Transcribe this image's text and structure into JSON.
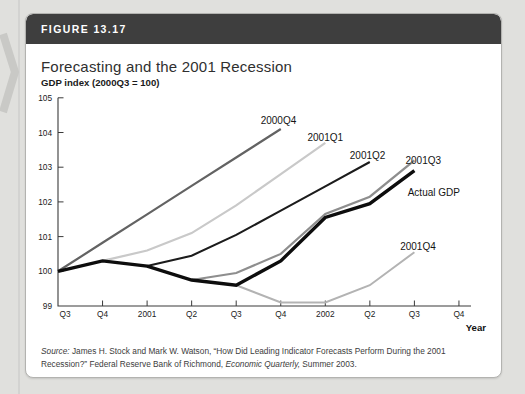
{
  "figure_label": "FIGURE 13.17",
  "title": "Forecasting and the 2001 Recession",
  "chart_data": {
    "type": "line",
    "ylabel_top": "GDP index (2000Q3 = 100)",
    "xlabel": "Year",
    "ylim": [
      99,
      105
    ],
    "yticks": [
      99,
      100,
      101,
      102,
      103,
      104,
      105
    ],
    "x_ticklabels": [
      "Q3",
      "Q4",
      "2001",
      "Q2",
      "Q3",
      "Q4",
      "2002",
      "Q2",
      "Q3",
      "Q4"
    ],
    "grid": false,
    "legend_style": "end-of-line labels",
    "series": [
      {
        "name": "2000Q4",
        "start": 0,
        "values": [
          100,
          100.82,
          101.64,
          102.46,
          103.28,
          104.1
        ],
        "color": "#636363",
        "width": 2.2,
        "label_at": [
          4.55,
          104.24
        ]
      },
      {
        "name": "2001Q1",
        "start": 1,
        "values": [
          100.3,
          100.6,
          101.1,
          101.9,
          102.8,
          103.7
        ],
        "color": "#c9c9c9",
        "width": 2.2,
        "label_at": [
          5.6,
          103.75
        ]
      },
      {
        "name": "2001Q2",
        "start": 2,
        "values": [
          100.15,
          100.45,
          101.05,
          101.75,
          102.45,
          103.15
        ],
        "color": "#1c1c1c",
        "width": 2.1,
        "label_at": [
          6.55,
          103.24
        ]
      },
      {
        "name": "2001Q3",
        "start": 3,
        "values": [
          99.75,
          99.95,
          100.5,
          101.65,
          102.15,
          103.2
        ],
        "color": "#8e8e8e",
        "width": 2.2,
        "label_at": [
          7.8,
          103.09
        ]
      },
      {
        "name": "2001Q4",
        "start": 4,
        "values": [
          99.6,
          99.1,
          99.1,
          99.6,
          100.55
        ],
        "color": "#b3b3b3",
        "width": 2.0,
        "label_at": [
          7.68,
          100.61
        ]
      },
      {
        "name": "Actual GDP",
        "start": 0,
        "values": [
          100,
          100.3,
          100.15,
          99.75,
          99.6,
          100.3,
          101.55,
          101.95,
          102.9
        ],
        "color": "#0d0d0d",
        "width": 3.4,
        "label_at": [
          7.85,
          102.17
        ]
      }
    ]
  },
  "source_lines": [
    [
      {
        "t": "Source:",
        "i": true
      },
      {
        "t": " James H. Stock and Mark W. Watson, “How Did Leading Indicator Forecasts Perform During the 2001",
        "i": false
      }
    ],
    [
      {
        "t": "Recession?” Federal Reserve Bank of Richmond, ",
        "i": false
      },
      {
        "t": "Economic Quarterly,",
        "i": true
      },
      {
        "t": " Summer 2003.",
        "i": false
      }
    ]
  ]
}
